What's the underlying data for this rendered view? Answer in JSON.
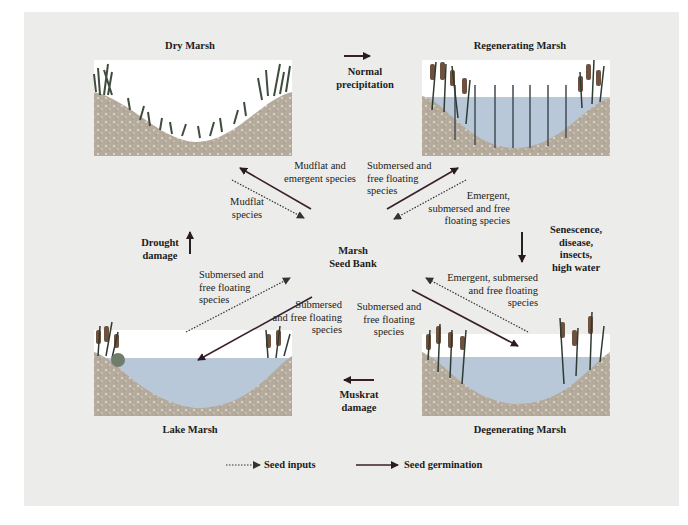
{
  "panels": {
    "dry": {
      "title": "Dry Marsh"
    },
    "regenerating": {
      "title": "Regenerating Marsh"
    },
    "lake": {
      "title": "Lake Marsh"
    },
    "degenerating": {
      "title": "Degenerating Marsh"
    }
  },
  "center": {
    "line1": "Marsh",
    "line2": "Seed Bank"
  },
  "transitions": {
    "normal_precipitation": {
      "line1": "Normal",
      "line2": "precipitation"
    },
    "senescence": {
      "line1": "Senescence,",
      "line2": "disease,",
      "line3": "insects,",
      "line4": "high water"
    },
    "muskrat": {
      "line1": "Muskrat",
      "line2": "damage"
    },
    "drought": {
      "line1": "Drought",
      "line2": "damage"
    }
  },
  "flows": {
    "dry_germ": {
      "line1": "Mudflat and",
      "line2": "emergent species"
    },
    "dry_input": {
      "line1": "Mudflat",
      "line2": "species"
    },
    "regen_germ": {
      "line1": "Submersed and",
      "line2": "free floating",
      "line3": "species"
    },
    "regen_input": {
      "line1": "Emergent,",
      "line2": "submersed and free",
      "line3": "floating species"
    },
    "lake_input": {
      "line1": "Submersed and",
      "line2": "free floating",
      "line3": "species"
    },
    "lake_germ": {
      "line1": "Submersed",
      "line2": "and free floating",
      "line3": "species"
    },
    "degen_germ": {
      "line1": "Submersed and",
      "line2": "free floating",
      "line3": "species"
    },
    "degen_input": {
      "line1": "Emergent, submersed",
      "line2": "and free floating",
      "line3": "species"
    }
  },
  "legend": {
    "seed_inputs": "Seed inputs",
    "seed_germination": "Seed germination"
  },
  "colors": {
    "background": "#ecedea",
    "soil": "#b8ad9e",
    "water": "#b9c8d8",
    "germination_arrow": "#3a1f2a",
    "vegetation": "#3c4a3c",
    "cattail": "#7a5a43"
  }
}
